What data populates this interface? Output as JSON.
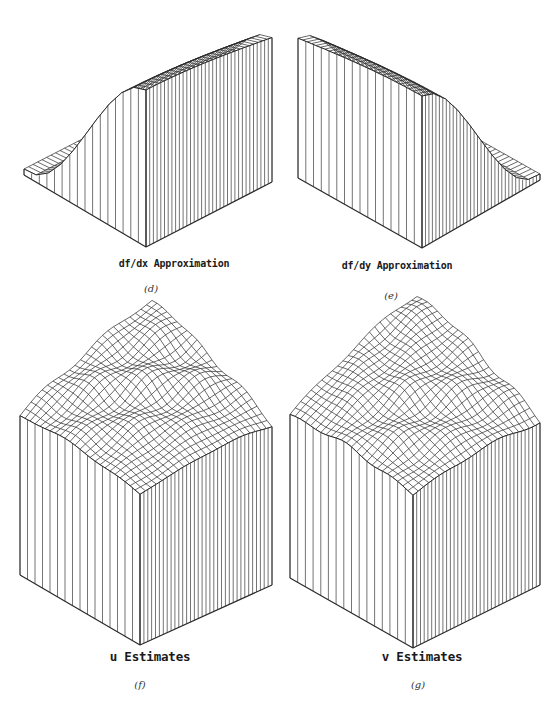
{
  "figure": {
    "panels": [
      {
        "id": "d",
        "title": "df/dx Approximation",
        "caption": "(d)",
        "title_pos": [
          174,
          266
        ],
        "caption_pos": [
          151,
          290
        ],
        "title_size": "small",
        "surface": "ramp-left-low",
        "geometry": {
          "front_bottom": [
            146,
            247
          ],
          "left_bottom": [
            24,
            175
          ],
          "right_bottom": [
            272,
            182
          ],
          "left_low_z": 6,
          "right_high_z": 157
        }
      },
      {
        "id": "e",
        "title": "df/dy Approximation",
        "caption": "(e)",
        "title_pos": [
          397,
          268
        ],
        "caption_pos": [
          391,
          297
        ],
        "title_size": "small",
        "surface": "ramp-right-low",
        "geometry": {
          "front_bottom": [
            422,
            248
          ],
          "left_bottom": [
            298,
            178
          ],
          "right_bottom": [
            540,
            180
          ],
          "left_high_z": 152,
          "right_low_z": 6
        }
      },
      {
        "id": "f",
        "title": "u Estimates",
        "caption": "(f)",
        "title_pos": [
          150,
          657
        ],
        "caption_pos": [
          140,
          686
        ],
        "title_size": "large",
        "surface": "block-bumpy",
        "geometry": {
          "front_bottom": [
            140,
            645
          ],
          "left_bottom": [
            20,
            575
          ],
          "right_bottom": [
            272,
            585
          ],
          "height": 150,
          "peak_rise": 65
        }
      },
      {
        "id": "g",
        "title": "v Estimates",
        "caption": "(g)",
        "title_pos": [
          422,
          657
        ],
        "caption_pos": [
          418,
          686
        ],
        "title_size": "large",
        "surface": "block-bumpy",
        "geometry": {
          "front_bottom": [
            413,
            648
          ],
          "left_bottom": [
            290,
            578
          ],
          "right_bottom": [
            540,
            585
          ],
          "height": 153,
          "peak_rise": 68
        }
      }
    ],
    "line_color": "#2a2a2a",
    "background": "#ffffff"
  }
}
